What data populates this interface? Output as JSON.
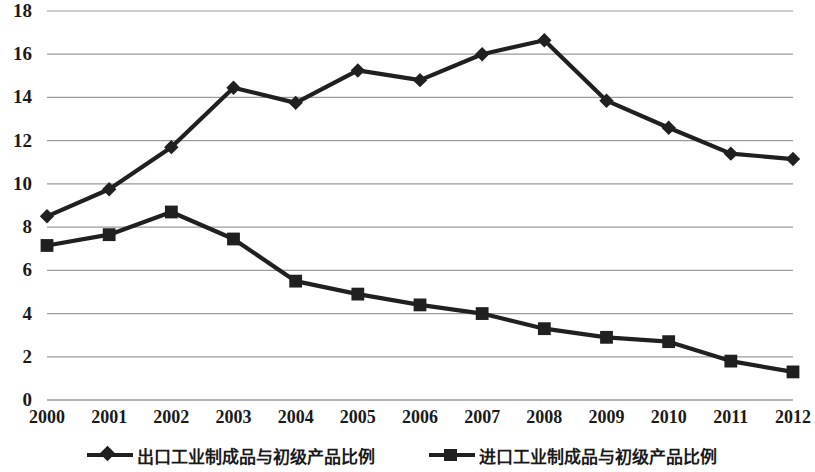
{
  "chart_data": {
    "type": "line",
    "title": "",
    "xlabel": "",
    "ylabel": "",
    "categories": [
      "2000",
      "2001",
      "2002",
      "2003",
      "2004",
      "2005",
      "2006",
      "2007",
      "2008",
      "2009",
      "2010",
      "2011",
      "2012"
    ],
    "ylim": [
      0,
      18
    ],
    "ytick_step": 2,
    "ytick_labels": [
      "0",
      "2",
      "4",
      "6",
      "8",
      "10",
      "12",
      "14",
      "16",
      "18"
    ],
    "grid": true,
    "grid_axis": "y",
    "grid_color": "#9a9a9a",
    "legend_position": "bottom",
    "series": [
      {
        "name": "出口工业制成品与初级产品比例",
        "marker": "diamond",
        "color": "#202020",
        "values": [
          8.5,
          9.75,
          11.7,
          14.45,
          13.75,
          15.25,
          14.8,
          16.0,
          16.65,
          13.85,
          12.6,
          11.4,
          11.15
        ]
      },
      {
        "name": "进口工业制成品与初级产品比例",
        "marker": "square",
        "color": "#202020",
        "values": [
          7.15,
          7.65,
          8.7,
          7.45,
          5.5,
          4.9,
          4.4,
          4.0,
          3.3,
          2.9,
          2.7,
          1.8,
          1.3
        ]
      }
    ]
  },
  "legend": {
    "items": [
      {
        "label": "出口工业制成品与初级产品比例",
        "marker": "diamond"
      },
      {
        "label": "进口工业制成品与初级产品比例",
        "marker": "square"
      }
    ]
  }
}
